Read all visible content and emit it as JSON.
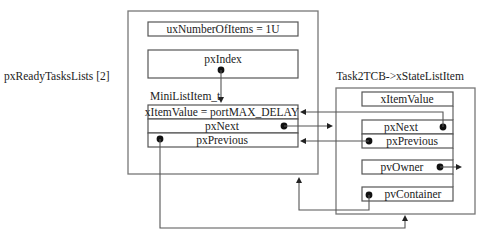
{
  "diagram": {
    "list_label": "pxReadyTasksLists [2]",
    "list": {
      "ux_number_of_items": "uxNumberOfItems = 1U",
      "px_index": "pxIndex",
      "mini_list_item_label": "MiniListItem_t",
      "mini_item_value": "xItemValue = portMAX_DELAY",
      "mini_px_next": "pxNext",
      "mini_px_previous": "pxPrevious"
    },
    "tcb": {
      "label": "Task2TCB->xStateListItem",
      "item_value": "xItemValue",
      "px_next": "pxNext",
      "px_previous": "pxPrevious",
      "pv_owner": "pvOwner",
      "pv_container": "pvContainer"
    }
  }
}
